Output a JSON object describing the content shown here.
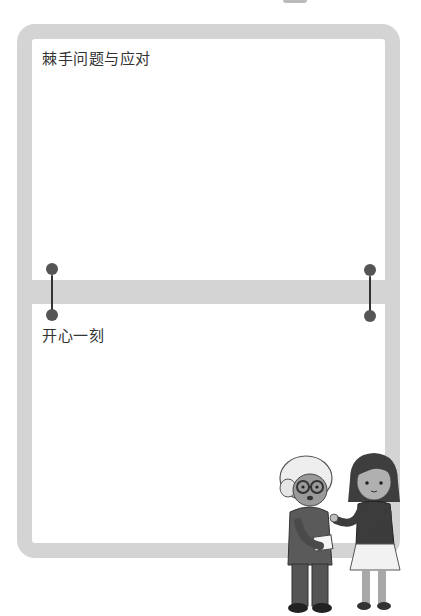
{
  "sections": [
    {
      "title": "棘手问题与应对"
    },
    {
      "title": "开心一刻"
    }
  ],
  "colors": {
    "frame": "#d4d4d4",
    "ring": "#555555",
    "text": "#333333"
  },
  "illustration": {
    "characters": [
      "elderly-woman",
      "girl"
    ]
  }
}
